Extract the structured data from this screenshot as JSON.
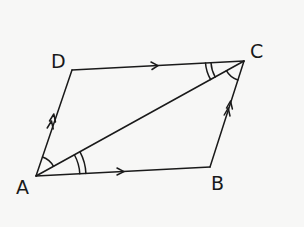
{
  "diagram": {
    "stroke_color": "#1a1a1a",
    "background": "#f7f7f6",
    "vertices": {
      "A": {
        "label": "A",
        "x": 36,
        "y": 176
      },
      "B": {
        "label": "B",
        "x": 210,
        "y": 167
      },
      "C": {
        "label": "C",
        "x": 244,
        "y": 61
      },
      "D": {
        "label": "D",
        "x": 72,
        "y": 70
      }
    },
    "sides": [
      {
        "from": "A",
        "to": "B",
        "parallel_marks": 1
      },
      {
        "from": "D",
        "to": "C",
        "parallel_marks": 1
      },
      {
        "from": "A",
        "to": "D",
        "parallel_marks": 2
      },
      {
        "from": "B",
        "to": "C",
        "parallel_marks": 2
      },
      {
        "from": "A",
        "to": "C",
        "parallel_marks": 0,
        "type": "diagonal"
      }
    ],
    "angle_marks": [
      {
        "vertex": "A",
        "between": [
          "AD",
          "AC"
        ],
        "arcs": 1
      },
      {
        "vertex": "A",
        "between": [
          "AC",
          "AB"
        ],
        "arcs": 2
      },
      {
        "vertex": "C",
        "between": [
          "CD",
          "CA"
        ],
        "arcs": 2
      },
      {
        "vertex": "C",
        "between": [
          "CA",
          "CB"
        ],
        "arcs": 1
      }
    ]
  }
}
